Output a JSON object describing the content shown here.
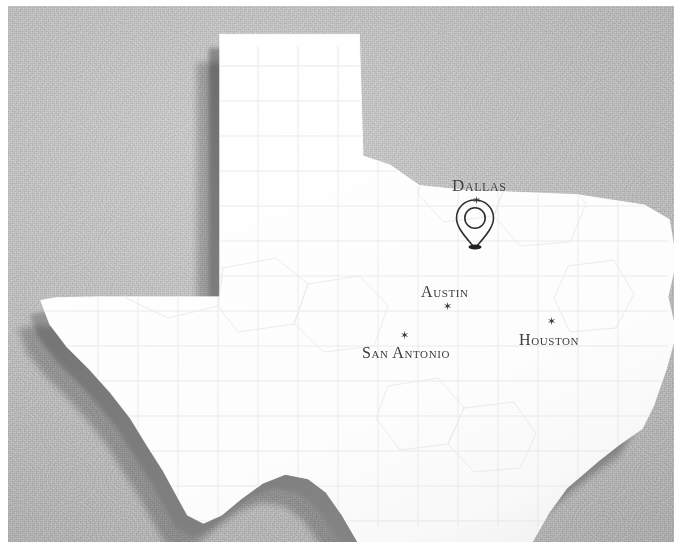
{
  "image": {
    "subject": "Texas state map",
    "width": 680,
    "height": 553,
    "background_color": "#c9c9c9",
    "landmass_color": "#ffffff",
    "extrusion_shadow_color": "#8d8d8d",
    "county_line_color": "#e4e4e4",
    "label_color": "#3b3b3b",
    "border_color": "#ffffff"
  },
  "map": {
    "state_name": "Texas",
    "style": "3d-extruded-paper-relief",
    "cities": [
      {
        "name": "Dallas",
        "label": "Dallas",
        "marker": "star",
        "x": 477,
        "y": 201,
        "label_x": 460,
        "label_y": 185
      },
      {
        "name": "Austin",
        "label": "Austin",
        "marker": "star",
        "x": 448,
        "y": 307,
        "label_x": 429,
        "label_y": 292
      },
      {
        "name": "San Antonio",
        "label": "San Antonio",
        "marker": "star",
        "x": 405,
        "y": 336,
        "label_x": 370,
        "label_y": 353
      },
      {
        "name": "Houston",
        "label": "Houston",
        "marker": "star",
        "x": 552,
        "y": 322,
        "label_x": 527,
        "label_y": 340
      }
    ],
    "pin": {
      "type": "location-pin",
      "style": "outline-teardrop-with-circle",
      "x": 475,
      "y": 248,
      "anchored_city": "Dallas",
      "stroke_color": "#2e2e2e"
    }
  },
  "markers": {
    "star_glyph": "✶"
  }
}
